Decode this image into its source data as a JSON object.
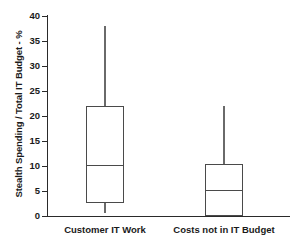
{
  "chart_data": {
    "type": "box",
    "title": "",
    "xlabel": "",
    "ylabel": "Stealth Spending / Total IT Budget - %",
    "ylim": [
      0,
      40
    ],
    "ytick_step": 5,
    "yticks": [
      "40",
      "35",
      "30",
      "25",
      "20",
      "15",
      "10",
      "5",
      "0"
    ],
    "ytick_values": [
      40,
      35,
      30,
      25,
      20,
      15,
      10,
      5,
      0
    ],
    "grid": false,
    "legend": "none",
    "categories": [
      "Customer IT Work",
      "Costs not in IT Budget"
    ],
    "series": [
      {
        "name": "Customer IT Work",
        "whisker_low": 0.6,
        "q1": 2.6,
        "median": 10.2,
        "q3": 22.0,
        "whisker_high": 38.0
      },
      {
        "name": "Costs not in IT Budget",
        "whisker_low": 0.0,
        "q1": 0.0,
        "median": 5.2,
        "q3": 10.5,
        "whisker_high": 22.0
      }
    ],
    "colors": {
      "axis": "#2a2a2a",
      "box_edge": "#4a4a4a",
      "whisker": "#6a6a6a",
      "background": "#ffffff",
      "text": "#1a1a1a"
    }
  },
  "axis": {
    "y_title": "Stealth Spending / Total IT Budget - %",
    "ticks": [
      {
        "label": "40"
      },
      {
        "label": "35"
      },
      {
        "label": "30"
      },
      {
        "label": "25"
      },
      {
        "label": "20"
      },
      {
        "label": "15"
      },
      {
        "label": "10"
      },
      {
        "label": "5"
      },
      {
        "label": "0"
      }
    ]
  },
  "categories": [
    {
      "label": "Customer IT Work"
    },
    {
      "label": "Costs not in IT Budget"
    }
  ]
}
